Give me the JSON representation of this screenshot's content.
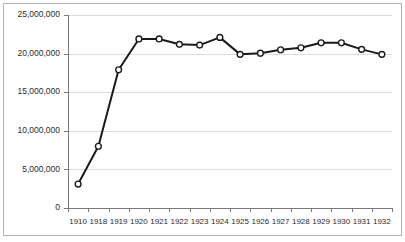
{
  "chart_data": {
    "type": "line",
    "title": "",
    "subtitle": "",
    "xlabel": "",
    "ylabel": "",
    "categories": [
      "1910",
      "1918",
      "1919",
      "1920",
      "1921",
      "1922",
      "1923",
      "1924",
      "1925",
      "1926",
      "1927",
      "1928",
      "1929",
      "1930",
      "1931",
      "1932"
    ],
    "values": [
      3100000,
      8000000,
      17900000,
      21900000,
      21900000,
      21200000,
      21100000,
      22100000,
      19900000,
      20050000,
      20500000,
      20750000,
      21400000,
      21400000,
      20550000,
      19900000
    ],
    "series": [
      {
        "name": "",
        "values": [
          3100000,
          8000000,
          17900000,
          21900000,
          21900000,
          21200000,
          21100000,
          22100000,
          19900000,
          20050000,
          20500000,
          20750000,
          21400000,
          21400000,
          20550000,
          19900000
        ]
      }
    ],
    "ylim": [
      0,
      25000000
    ],
    "yticks": [
      0,
      5000000,
      10000000,
      15000000,
      20000000,
      25000000
    ],
    "ytick_labels": [
      "0",
      "5,000,000",
      "10,000,000",
      "15,000,000",
      "20,000,000",
      "25,000,000"
    ],
    "grid": true,
    "grid_axis": "y",
    "legend": false,
    "legend_position": "none",
    "marker": "circle-open",
    "line_color": "#1a1a1a",
    "marker_fill": "#ffffff",
    "grid_color": "#dcdcdc",
    "axis_color": "#7a7a7a",
    "frame_color": "#b4b4b4",
    "background": "#ffffff",
    "annotations": []
  }
}
